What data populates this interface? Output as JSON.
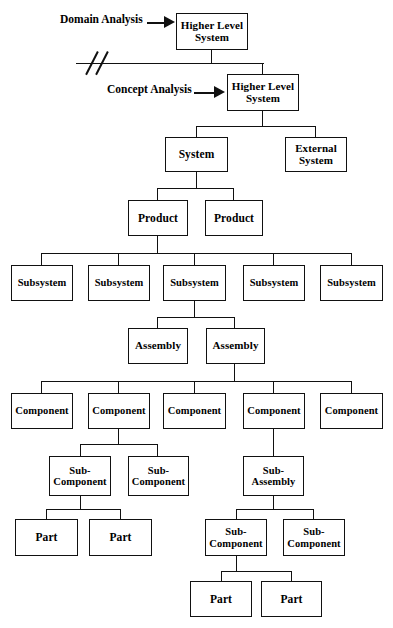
{
  "diagram": {
    "annotations": [
      {
        "name": "domain-analysis",
        "label": "Domain Analysis"
      },
      {
        "name": "concept-analysis",
        "label": "Concept Analysis"
      }
    ],
    "levels": [
      {
        "name": "higher-level-system-top",
        "nodes": [
          {
            "label": "Higher Level\nSystem"
          }
        ]
      },
      {
        "name": "higher-level-system-second",
        "nodes": [
          {
            "label": "Higher Level\nSystem"
          }
        ]
      },
      {
        "name": "system-level",
        "nodes": [
          {
            "label": "System"
          },
          {
            "label": "External\nSystem"
          }
        ]
      },
      {
        "name": "product-level",
        "nodes": [
          {
            "label": "Product"
          },
          {
            "label": "Product"
          }
        ]
      },
      {
        "name": "subsystem-level",
        "nodes": [
          {
            "label": "Subsystem"
          },
          {
            "label": "Subsystem"
          },
          {
            "label": "Subsystem"
          },
          {
            "label": "Subsystem"
          },
          {
            "label": "Subsystem"
          }
        ]
      },
      {
        "name": "assembly-level",
        "nodes": [
          {
            "label": "Assembly"
          },
          {
            "label": "Assembly"
          }
        ]
      },
      {
        "name": "component-level",
        "nodes": [
          {
            "label": "Component"
          },
          {
            "label": "Component"
          },
          {
            "label": "Component"
          },
          {
            "label": "Component"
          },
          {
            "label": "Component"
          }
        ]
      },
      {
        "name": "subcomponent-subassembly-level",
        "nodes": [
          {
            "label": "Sub-\nComponent"
          },
          {
            "label": "Sub-\nComponent"
          },
          {
            "label": "Sub-\nAssembly"
          }
        ]
      },
      {
        "name": "part-and-subcomponent-level",
        "nodes": [
          {
            "label": "Part"
          },
          {
            "label": "Part"
          },
          {
            "label": "Sub-\nComponent"
          },
          {
            "label": "Sub-\nComponent"
          }
        ]
      },
      {
        "name": "bottom-part-level",
        "nodes": [
          {
            "label": "Part"
          },
          {
            "label": "Part"
          }
        ]
      }
    ]
  },
  "colors": {
    "line": "#111111",
    "background": "#ffffff",
    "text": "#000000"
  }
}
